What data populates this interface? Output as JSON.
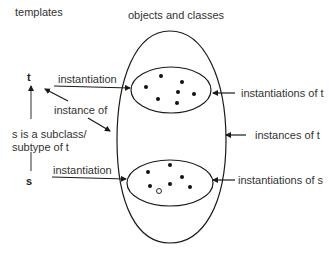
{
  "headings": {
    "templates": "templates",
    "objects_and_classes": "objects and classes"
  },
  "variables": {
    "t": "t",
    "s": "s"
  },
  "labels": {
    "instantiation_t": "instantiation",
    "instance_of": "instance of",
    "subclass_line1": "s is a subclass/",
    "subclass_line2": "subtype of t",
    "instantiation_s": "instantiation",
    "instantiations_of_t": "instantiations of t",
    "instances_of_t": "instances of t",
    "instantiations_of_s": "instantiations of s"
  },
  "colors": {
    "stroke": "#1a1a1a",
    "text": "#333333"
  }
}
